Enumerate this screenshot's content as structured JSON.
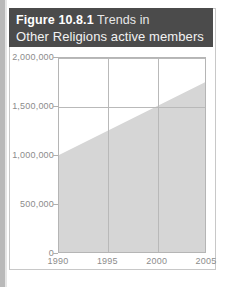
{
  "figure": {
    "label": "Figure",
    "number": "10.8.1",
    "title_part_1": "Trends in",
    "title_line_2": "Other Religions active members"
  },
  "colors": {
    "title_bar_bg": "#4b4b4b",
    "title_text": "#ffffff",
    "area_fill": "#d6d6d6",
    "grid": "#b9b9b9",
    "axis_text": "#8c8c8c",
    "frame": "#b5b5b5"
  },
  "chart_data": {
    "type": "area",
    "title": "Figure 10.8.1 Trends in Other Religions active members",
    "xlabel": "",
    "ylabel": "",
    "x": [
      1990,
      1995,
      2000,
      2005
    ],
    "values": [
      1000000,
      1250000,
      1500000,
      1750000
    ],
    "series": [
      {
        "name": "Other Religions active members",
        "values": [
          1000000,
          1250000,
          1500000,
          1750000
        ]
      }
    ],
    "xlim": [
      1990,
      2005
    ],
    "ylim": [
      0,
      2000000
    ],
    "xticks": [
      1990,
      1995,
      2000,
      2005
    ],
    "xtick_labels": [
      "1990",
      "1995",
      "2000",
      "2005"
    ],
    "yticks": [
      0,
      500000,
      1000000,
      1500000,
      2000000
    ],
    "ytick_labels": [
      "0",
      "500,000",
      "1,000,000",
      "1,500,000",
      "2,000,000"
    ],
    "gridlines_vertical_at": [
      1995,
      2000
    ],
    "gridlines_horizontal_at": [
      1500000,
      2000000
    ],
    "grid": true,
    "legend": false
  }
}
